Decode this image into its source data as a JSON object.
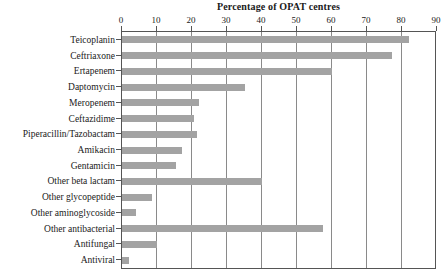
{
  "chart_data": {
    "type": "bar",
    "orientation": "horizontal",
    "title": "Percentage of OPAT centres",
    "xlabel": "",
    "ylabel": "",
    "xlim": [
      0,
      90
    ],
    "xticks": [
      0,
      10,
      20,
      30,
      40,
      50,
      60,
      70,
      80,
      90
    ],
    "grid": true,
    "legend": false,
    "bar_color": "#a3a3a3",
    "categories": [
      "Teicoplanin",
      "Ceftriaxone",
      "Ertapenem",
      "Daptomycin",
      "Meropenem",
      "Ceftazidime",
      "Piperacillin/Tazobactam",
      "Amikacin",
      "Gentamicin",
      "Other beta lactam",
      "Other glycopeptide",
      "Other aminoglycoside",
      "Other antibacterial",
      "Antifungal",
      "Antiviral"
    ],
    "values": [
      82,
      77,
      60,
      35,
      22,
      20.5,
      21.5,
      17,
      15.5,
      40,
      8.5,
      4,
      57.5,
      10,
      2
    ]
  }
}
